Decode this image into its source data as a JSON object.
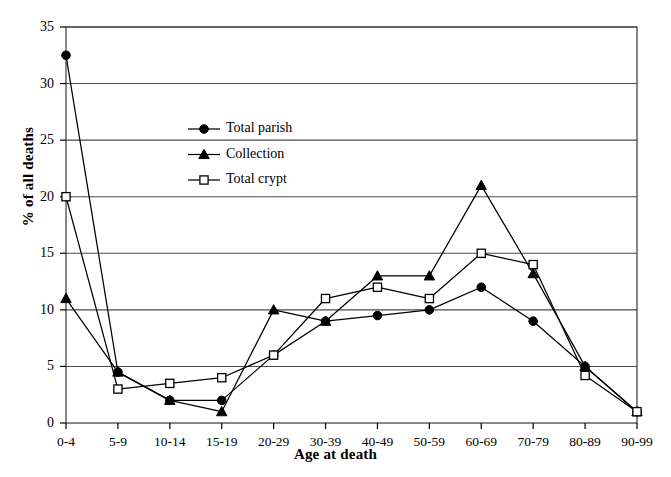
{
  "chart_data": {
    "type": "line",
    "title": "",
    "xlabel": "Age at death",
    "ylabel": "% of all deaths",
    "categories": [
      "0-4",
      "5-9",
      "10-14",
      "15-19",
      "20-29",
      "30-39",
      "40-49",
      "50-59",
      "60-69",
      "70-79",
      "80-89",
      "90-99"
    ],
    "ylim": [
      0,
      35
    ],
    "yticks": [
      0,
      5,
      10,
      15,
      20,
      25,
      30,
      35
    ],
    "grid": "horizontal",
    "legend_position": "upper-left-inside",
    "series": [
      {
        "name": "Total parish",
        "marker": "filled-circle",
        "values": [
          32.5,
          4.5,
          2.0,
          2.0,
          6.0,
          9.0,
          9.5,
          10.0,
          12.0,
          9.0,
          5.0,
          1.0
        ]
      },
      {
        "name": "Collection",
        "marker": "filled-triangle",
        "values": [
          11.0,
          4.5,
          2.0,
          1.0,
          10.0,
          9.0,
          13.0,
          13.0,
          21.0,
          13.2,
          5.0,
          1.0
        ]
      },
      {
        "name": "Total crypt",
        "marker": "open-square",
        "values": [
          20.0,
          3.0,
          3.5,
          4.0,
          6.0,
          11.0,
          12.0,
          11.0,
          15.0,
          14.0,
          4.2,
          1.0
        ]
      }
    ]
  },
  "axis": {
    "y_tick_labels": [
      "0",
      "5",
      "10",
      "15",
      "20",
      "25",
      "30",
      "35"
    ],
    "x_tick_labels": [
      "0-4",
      "5-9",
      "10-14",
      "15-19",
      "20-29",
      "30-39",
      "40-49",
      "50-59",
      "60-69",
      "70-79",
      "80-89",
      "90-99"
    ],
    "y_title": "% of all deaths",
    "x_title": "Age at death"
  },
  "legend": {
    "entries": [
      {
        "label": "Total parish"
      },
      {
        "label": "Collection"
      },
      {
        "label": "Total crypt"
      }
    ]
  },
  "colors": {
    "line": "#000000",
    "grid": "#000000",
    "frame": "#000000",
    "background": "#ffffff"
  }
}
